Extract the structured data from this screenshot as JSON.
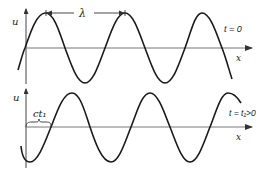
{
  "figure": {
    "colors": {
      "stroke": "#1a1a1a",
      "axis": "#555555",
      "background": "#ffffff"
    }
  },
  "panels": [
    {
      "id": "top",
      "y_label": "u",
      "x_label": "x",
      "time_label": "t = 0",
      "annotation": {
        "type": "wavelength",
        "label": "λ"
      }
    },
    {
      "id": "bottom",
      "y_label": "u",
      "x_label": "x",
      "time_label": "t = t₁>0",
      "annotation": {
        "type": "displacement",
        "label": "ct₁"
      }
    }
  ]
}
